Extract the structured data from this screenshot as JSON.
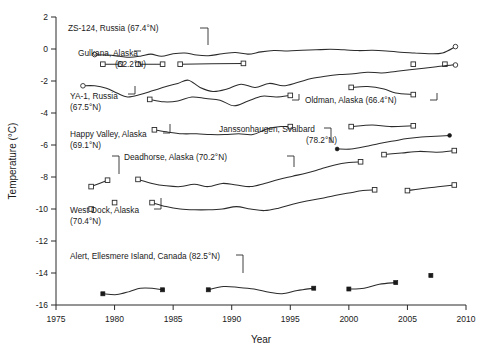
{
  "chart_data": {
    "type": "line",
    "title": "",
    "xlabel": "Year",
    "ylabel": "Temperature (°C)",
    "xlim": [
      1975,
      2010
    ],
    "ylim": [
      -16,
      2
    ],
    "xticks": [
      1975,
      1980,
      1985,
      1990,
      1995,
      2000,
      2005,
      2010
    ],
    "yticks": [
      2,
      0,
      -2,
      -4,
      -6,
      -8,
      -10,
      -12,
      -14,
      -16
    ],
    "grid": false,
    "legend": "inline-annotations",
    "series": [
      {
        "name": "ZS-124, Russia (67.4°N)",
        "marker": "open-circle",
        "segments": [
          {
            "x": [
              1978.3,
              1979.4,
              1980.4,
              1981.3,
              1982.2,
              1983.1,
              1984.0,
              1985.0,
              1986.0,
              1987.0,
              1988.0,
              1989.2,
              1990.3,
              1991.4,
              1992.5,
              1993.6,
              1994.8,
              1996.0,
              1997.2,
              1998.4,
              1999.6,
              2000.8,
              2002.0,
              2003.2,
              2004.4,
              2005.6,
              2006.8,
              2008.0,
              2009.1
            ],
            "y": [
              -0.35,
              -0.38,
              -0.45,
              -0.52,
              -0.45,
              -0.32,
              -0.45,
              -0.3,
              -0.25,
              -0.38,
              -0.42,
              -0.3,
              -0.22,
              -0.32,
              -0.18,
              -0.1,
              -0.12,
              -0.08,
              -0.05,
              -0.02,
              -0.05,
              -0.1,
              -0.08,
              -0.12,
              -0.2,
              -0.25,
              -0.3,
              -0.25,
              0.15
            ]
          }
        ],
        "endpoint_markers": [
          [
            1978.3,
            -0.35
          ],
          [
            2009.1,
            0.15
          ]
        ]
      },
      {
        "name": "Gulkana, Alaska (62.2°N)",
        "marker": "open-square",
        "segments": [
          {
            "x": [
              1979.0,
              1980.5
            ],
            "y": [
              -0.95,
              -0.95
            ]
          },
          {
            "x": [
              1982.0,
              1984.1
            ],
            "y": [
              -0.95,
              -0.95
            ]
          },
          {
            "x": [
              1985.6,
              1991.0
            ],
            "y": [
              -0.95,
              -0.9
            ]
          },
          {
            "x": [
              2005.5,
              2005.5
            ],
            "y": [
              -0.95,
              -0.95
            ]
          },
          {
            "x": [
              2008.2,
              2008.2
            ],
            "y": [
              -0.95,
              -0.95
            ]
          }
        ],
        "endpoint_markers": [
          [
            1979.0,
            -0.95
          ],
          [
            1980.5,
            -0.95
          ],
          [
            1982.0,
            -0.95
          ],
          [
            1984.1,
            -0.95
          ],
          [
            1985.6,
            -0.95
          ],
          [
            1991.0,
            -0.9
          ],
          [
            2005.5,
            -0.95
          ],
          [
            2008.2,
            -0.95
          ]
        ]
      },
      {
        "name": "YA-1, Russia (67.5°N)",
        "marker": "open-circle",
        "segments": [
          {
            "x": [
              1977.3,
              1978.3,
              1979.3,
              1980.2,
              1981.1,
              1982.2,
              1983.3,
              1984.4,
              1985.4,
              1986.3,
              1987.3,
              1988.4,
              1989.6,
              1990.8,
              1992.0,
              1993.2,
              1994.4,
              1995.6,
              1996.8,
              1998.0,
              1999.2,
              2000.4,
              2001.6,
              2002.8,
              2004.0,
              2005.2,
              2006.4,
              2007.6,
              2008.8,
              2009.1
            ],
            "y": [
              -2.3,
              -2.3,
              -2.45,
              -2.75,
              -3.0,
              -2.85,
              -2.6,
              -2.35,
              -2.15,
              -1.95,
              -2.4,
              -2.65,
              -2.5,
              -2.2,
              -2.4,
              -2.15,
              -2.3,
              -2.1,
              -1.85,
              -1.7,
              -1.6,
              -1.55,
              -1.45,
              -1.5,
              -1.4,
              -1.3,
              -1.2,
              -1.1,
              -1.0,
              -1.0
            ]
          }
        ],
        "endpoint_markers": [
          [
            1977.3,
            -2.3
          ],
          [
            2009.1,
            -1.0
          ]
        ]
      },
      {
        "name": "Oldman, Alaska (66.4°N)",
        "marker": "open-square",
        "segments": [
          {
            "x": [
              1983.0,
              1984.2,
              1985.4,
              1986.6,
              1987.8,
              1989.0,
              1990.2,
              1991.4,
              1992.6,
              1993.8,
              1995.0
            ],
            "y": [
              -3.15,
              -3.3,
              -3.25,
              -3.0,
              -3.1,
              -3.2,
              -3.55,
              -3.25,
              -2.95,
              -3.0,
              -2.9
            ]
          },
          {
            "x": [
              2000.2,
              2001.6,
              2003.0,
              2004.0,
              2005.5
            ],
            "y": [
              -2.4,
              -2.35,
              -2.5,
              -2.75,
              -2.85
            ]
          }
        ],
        "endpoint_markers": [
          [
            1983.0,
            -3.15
          ],
          [
            1995.0,
            -2.9
          ],
          [
            2000.2,
            -2.4
          ],
          [
            2005.5,
            -2.85
          ]
        ]
      },
      {
        "name": "Happy Valley, Alaska (69.1°N)",
        "marker": "open-square",
        "segments": [
          {
            "x": [
              1983.4,
              1984.6,
              1985.8,
              1987.0,
              1988.2,
              1989.4,
              1990.6,
              1991.8,
              1993.0,
              1994.2,
              1995.0
            ],
            "y": [
              -5.05,
              -5.2,
              -5.3,
              -5.3,
              -5.35,
              -5.35,
              -5.3,
              -5.35,
              -5.0,
              -4.85,
              -4.85
            ]
          },
          {
            "x": [
              2000.2,
              2002.0,
              2003.5,
              2005.5
            ],
            "y": [
              -4.85,
              -4.75,
              -4.85,
              -4.8
            ]
          }
        ],
        "endpoint_markers": [
          [
            1983.4,
            -5.05
          ],
          [
            1995.0,
            -4.85
          ],
          [
            2000.2,
            -4.85
          ],
          [
            2005.5,
            -4.8
          ]
        ]
      },
      {
        "name": "Janssonhaugen, Svalbard (78.2°N)",
        "marker": "filled-circle",
        "segments": [
          {
            "x": [
              1999.0,
              2000.2,
              2001.4,
              2002.6,
              2003.8,
              2005.0,
              2006.2,
              2007.4,
              2008.6
            ],
            "y": [
              -6.25,
              -6.25,
              -6.1,
              -5.9,
              -5.75,
              -5.6,
              -5.5,
              -5.45,
              -5.4
            ]
          }
        ],
        "endpoint_markers": [
          [
            1999.0,
            -6.25
          ],
          [
            2008.6,
            -5.4
          ]
        ]
      },
      {
        "name": "Deadhorse, Alaska (70.2°N)",
        "marker": "open-square",
        "segments": [
          {
            "x": [
              1978.0,
              1979.4
            ],
            "y": [
              -8.6,
              -8.2
            ]
          },
          {
            "x": [
              1982.0,
              1983.2,
              1984.4,
              1985.6,
              1986.8,
              1988.0,
              1989.2,
              1990.4,
              1991.6,
              1992.8,
              1994.0,
              1995.2,
              1996.4,
              1997.6,
              1998.8,
              2000.0,
              2001.0
            ],
            "y": [
              -8.15,
              -8.4,
              -8.55,
              -8.6,
              -8.45,
              -8.6,
              -8.4,
              -8.5,
              -8.6,
              -8.4,
              -8.15,
              -7.95,
              -7.75,
              -7.5,
              -7.25,
              -7.1,
              -7.05
            ]
          },
          {
            "x": [
              2003.0,
              2004.5,
              2006.0,
              2007.5,
              2009.0
            ],
            "y": [
              -6.6,
              -6.5,
              -6.4,
              -6.45,
              -6.35
            ]
          }
        ],
        "endpoint_markers": [
          [
            1978.0,
            -8.6
          ],
          [
            1979.4,
            -8.2
          ],
          [
            1982.0,
            -8.15
          ],
          [
            2001.0,
            -7.05
          ],
          [
            2003.0,
            -6.6
          ],
          [
            2009.0,
            -6.35
          ]
        ]
      },
      {
        "name": "West Dock, Alaska (70.4°N)",
        "marker": "open-square",
        "segments": [
          {
            "x": [
              1978.0,
              1978.0
            ],
            "y": [
              -10.0,
              -10.0
            ]
          },
          {
            "x": [
              1980.0,
              1980.0
            ],
            "y": [
              -9.6,
              -9.6
            ]
          },
          {
            "x": [
              1983.2,
              1984.4,
              1985.6,
              1986.8,
              1988.0,
              1989.2,
              1990.4,
              1991.6,
              1992.8,
              1994.0,
              1995.2,
              1996.4,
              1997.6,
              1998.8,
              2000.0,
              2001.2,
              2002.2
            ],
            "y": [
              -9.6,
              -9.85,
              -10.0,
              -10.05,
              -10.05,
              -10.0,
              -9.85,
              -10.0,
              -10.1,
              -9.95,
              -9.7,
              -9.5,
              -9.35,
              -9.15,
              -9.0,
              -8.85,
              -8.8
            ]
          },
          {
            "x": [
              2005.0,
              2006.5,
              2007.8,
              2009.0
            ],
            "y": [
              -8.85,
              -8.7,
              -8.6,
              -8.5
            ]
          }
        ],
        "endpoint_markers": [
          [
            1978.0,
            -10.0
          ],
          [
            1980.0,
            -9.6
          ],
          [
            1983.2,
            -9.6
          ],
          [
            2002.2,
            -8.8
          ],
          [
            2005.0,
            -8.85
          ],
          [
            2009.0,
            -8.5
          ]
        ]
      },
      {
        "name": "Alert, Ellesmere Island, Canada (82.5°N)",
        "marker": "filled-square",
        "segments": [
          {
            "x": [
              1979.0,
              1980.2,
              1981.3,
              1982.2,
              1983.2,
              1984.1
            ],
            "y": [
              -15.3,
              -15.35,
              -15.15,
              -14.95,
              -14.95,
              -15.05
            ]
          },
          {
            "x": [
              1988.0,
              1989.3,
              1990.6,
              1991.9,
              1993.2,
              1994.3,
              1995.6,
              1997.0
            ],
            "y": [
              -15.05,
              -14.85,
              -14.9,
              -15.0,
              -15.2,
              -15.3,
              -15.1,
              -14.95
            ]
          },
          {
            "x": [
              2000.0,
              2001.3,
              2002.6,
              2004.0
            ],
            "y": [
              -15.0,
              -14.95,
              -14.7,
              -14.6
            ]
          },
          {
            "x": [
              2007.0,
              2007.0
            ],
            "y": [
              -14.15,
              -14.15
            ]
          }
        ],
        "endpoint_markers": [
          [
            1979.0,
            -15.3
          ],
          [
            1984.1,
            -15.05
          ],
          [
            1988.0,
            -15.05
          ],
          [
            1997.0,
            -14.95
          ],
          [
            2000.0,
            -15.0
          ],
          [
            2004.0,
            -14.6
          ],
          [
            2007.0,
            -14.15
          ]
        ]
      }
    ],
    "annotations": [
      {
        "name": "zs124",
        "lines": [
          "ZS-124, Russia (67.4°N)"
        ],
        "x": 68,
        "y": 31,
        "anchor": "start"
      },
      {
        "name": "gulkana",
        "lines": [
          "Gulkana, Alaska",
          "(62.2°N)"
        ],
        "x": 78,
        "y": 56,
        "anchor": "start"
      },
      {
        "name": "ya1",
        "lines": [
          "YA-1, Russia",
          "(67.5°N)"
        ],
        "x": 70,
        "y": 99,
        "anchor": "start"
      },
      {
        "name": "oldman",
        "lines": [
          "Oldman, Alaska (66.4°N)"
        ],
        "x": 305,
        "y": 103,
        "anchor": "start"
      },
      {
        "name": "happy-valley",
        "lines": [
          "Happy Valley, Alaska",
          "(69.1°N)"
        ],
        "x": 70,
        "y": 137,
        "anchor": "start"
      },
      {
        "name": "janssonhaugen",
        "lines": [
          "Janssonhaugen, Svalbard",
          "(78.2°N)"
        ],
        "x": 219,
        "y": 132,
        "anchor": "start"
      },
      {
        "name": "deadhorse",
        "lines": [
          "Deadhorse, Alaska (70.2°N)"
        ],
        "x": 124,
        "y": 160,
        "anchor": "start"
      },
      {
        "name": "west-dock",
        "lines": [
          "West Dock, Alaska",
          "(70.4°N)"
        ],
        "x": 70,
        "y": 213,
        "anchor": "start"
      },
      {
        "name": "alert",
        "lines": [
          "Alert, Ellesmere Island, Canada (82.5°N)"
        ],
        "x": 70,
        "y": 259,
        "anchor": "start"
      }
    ]
  }
}
